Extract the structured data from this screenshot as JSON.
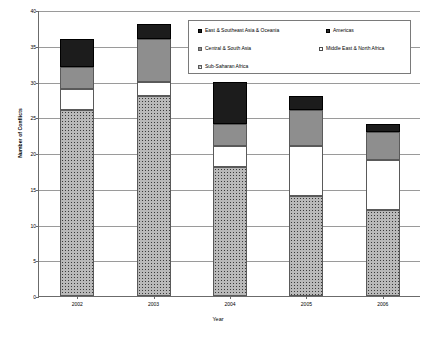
{
  "chart_data": {
    "type": "bar",
    "subtype": "stacked-vertical",
    "title": "",
    "xlabel": "Year",
    "ylabel": "Number of Conflicts",
    "categories": [
      "2002",
      "2003",
      "2004",
      "2005",
      "2006"
    ],
    "ylim": [
      0,
      40
    ],
    "ytick_step": 5,
    "yticks": [
      "0",
      "5",
      "10",
      "15",
      "20",
      "25",
      "30",
      "35",
      "40"
    ],
    "grid": "horizontal",
    "legend_position": "top-right-inside",
    "stack_order_bottom_to_top": [
      "Sub-Saharan Africa",
      "Middle East & North Africa",
      "Central & South Asia",
      "East & Southeast Asia & Oceania",
      "Americas"
    ],
    "series": [
      {
        "name": "Sub-Saharan Africa",
        "swatch": "stipple",
        "color": "#b9b9b9",
        "values": [
          26,
          28,
          18,
          14,
          12
        ]
      },
      {
        "name": "Middle East & North Africa",
        "swatch": "white",
        "color": "#ffffff",
        "values": [
          3,
          2,
          3,
          7,
          7
        ]
      },
      {
        "name": "Central & South Asia",
        "swatch": "gray",
        "color": "#8e8e8e",
        "values": [
          3,
          6,
          3,
          5,
          4
        ]
      },
      {
        "name": "East & Southeast Asia & Oceania",
        "swatch": "black",
        "color": "#1c1c1c",
        "values": [
          4,
          2,
          6,
          2,
          1
        ]
      },
      {
        "name": "Americas",
        "swatch": "darkgray",
        "color": "#2b2b2b",
        "values": [
          0,
          0,
          0,
          0,
          0
        ]
      }
    ],
    "totals": [
      36,
      38,
      30,
      28,
      24
    ]
  },
  "legend": {
    "entries": [
      {
        "label": "East & Southeast Asia & Oceania",
        "swatch": "black"
      },
      {
        "label": "Americas",
        "swatch": "darkgray"
      },
      {
        "label": "Central & South Asia",
        "swatch": "gray"
      },
      {
        "label": "Middle East & North Africa",
        "swatch": "white"
      },
      {
        "label": "Sub-Saharan Africa",
        "swatch": "stipple"
      }
    ]
  },
  "axes": {
    "y_title": "Number of Conflicts",
    "x_title": "Year"
  },
  "caption": {
    "text": ""
  }
}
